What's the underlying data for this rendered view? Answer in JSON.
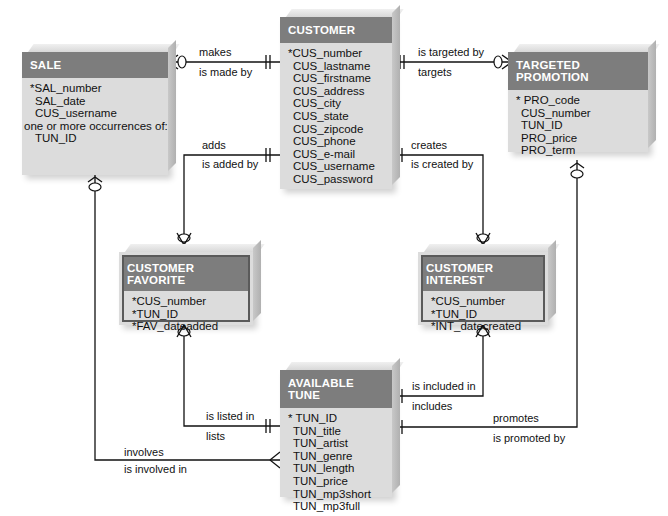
{
  "entities": {
    "sale": {
      "title": "SALE",
      "attributes": [
        "*SAL_number",
        "SAL_date",
        "CUS_username"
      ],
      "note": "one or more occurrences of:",
      "extra": [
        "TUN_ID"
      ]
    },
    "customer": {
      "title": "CUSTOMER",
      "attributes": [
        "*CUS_number",
        "CUS_lastname",
        "CUS_firstname",
        "CUS_address",
        "CUS_city",
        "CUS_state",
        "CUS_zipcode",
        "CUS_phone",
        "CUS_e-mail",
        "CUS_username",
        "CUS_password"
      ]
    },
    "targeted_promotion": {
      "title": "TARGETED PROMOTION",
      "attributes": [
        "* PRO_code",
        "CUS_number",
        "TUN_ID",
        "PRO_price",
        "PRO_term"
      ]
    },
    "customer_favorite": {
      "title": "CUSTOMER FAVORITE",
      "attributes": [
        "*CUS_number",
        "*TUN_ID",
        "*FAV_dateadded"
      ]
    },
    "customer_interest": {
      "title": "CUSTOMER INTEREST",
      "attributes": [
        "*CUS_number",
        "*TUN_ID",
        "*INT_datecreated"
      ]
    },
    "available_tune": {
      "title": "AVAILABLE TUNE",
      "attributes": [
        "* TUN_ID",
        "TUN_title",
        "TUN_artist",
        "TUN_genre",
        "TUN_length",
        "TUN_price",
        "TUN_mp3short",
        "TUN_mp3full"
      ]
    }
  },
  "relationships": {
    "customer_sale": {
      "forward": "makes",
      "reverse": "is made by"
    },
    "customer_promotion": {
      "forward": "is targeted by",
      "reverse": "targets"
    },
    "customer_favorite": {
      "forward": "adds",
      "reverse": "is added by"
    },
    "customer_interest": {
      "forward": "creates",
      "reverse": "is created by"
    },
    "tune_favorite": {
      "forward": "is listed in",
      "reverse": "lists"
    },
    "tune_interest": {
      "forward": "is included in",
      "reverse": "includes"
    },
    "tune_promotion": {
      "forward": "promotes",
      "reverse": "is promoted by"
    },
    "sale_tune": {
      "forward": "involves",
      "reverse": "is involved in"
    }
  },
  "colors": {
    "header": "#7d7d7d",
    "body": "#dcdcdc",
    "line": "#111111"
  }
}
